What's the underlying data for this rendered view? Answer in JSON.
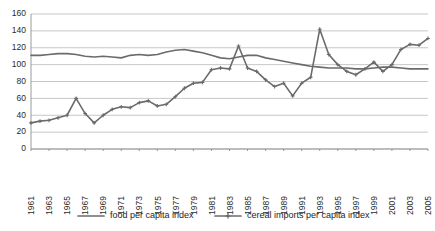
{
  "chart_data": {
    "type": "line",
    "title": "",
    "subtitle": "",
    "xlabel": "",
    "ylabel": "",
    "ylim": [
      0,
      160
    ],
    "ytick_step": 20,
    "yticks": [
      0,
      20,
      40,
      60,
      80,
      100,
      120,
      140,
      160
    ],
    "xlim": [
      1961,
      2005
    ],
    "grid": true,
    "grid_axis": "y",
    "legend_position": "bottom",
    "x": [
      1961,
      1962,
      1963,
      1964,
      1965,
      1966,
      1967,
      1968,
      1969,
      1970,
      1971,
      1972,
      1973,
      1974,
      1975,
      1976,
      1977,
      1978,
      1979,
      1980,
      1981,
      1982,
      1983,
      1984,
      1985,
      1986,
      1987,
      1988,
      1989,
      1990,
      1991,
      1992,
      1993,
      1994,
      1995,
      1996,
      1997,
      1998,
      1999,
      2000,
      2001,
      2002,
      2003,
      2004,
      2005
    ],
    "xticks": [
      1961,
      1963,
      1965,
      1967,
      1969,
      1971,
      1973,
      1975,
      1977,
      1979,
      1981,
      1983,
      1985,
      1987,
      1989,
      1991,
      1993,
      1995,
      1997,
      1999,
      2001,
      2003,
      2005
    ],
    "xtick_labels": [
      "1961",
      "1963",
      "1965",
      "1967",
      "1969",
      "1971",
      "1973",
      "1975",
      "1977",
      "1979",
      "1981",
      "1983",
      "1985",
      "1987",
      "1989",
      "1991",
      "1993",
      "1995",
      "1997",
      "1999",
      "2001",
      "2003",
      "2005"
    ],
    "series": [
      {
        "name": "food per capita index",
        "color": "#6b6b6b",
        "marker": "none",
        "line_width": 1.6,
        "values": [
          111,
          111,
          112,
          113,
          113,
          112,
          110,
          109,
          110,
          109,
          108,
          111,
          112,
          111,
          112,
          115,
          117,
          118,
          116,
          114,
          111,
          108,
          107,
          109,
          111,
          111,
          108,
          106,
          104,
          102,
          100,
          98,
          97,
          96,
          96,
          96,
          95,
          95,
          96,
          97,
          97,
          96,
          95,
          95,
          95
        ]
      },
      {
        "name": "cereal imports per capita index",
        "color": "#6b6b6b",
        "marker": "plus",
        "line_width": 1.6,
        "values": [
          31,
          33,
          34,
          36,
          38,
          40,
          41,
          41,
          42,
          44,
          44,
          44,
          60,
          42,
          32,
          44,
          50,
          54,
          55,
          62,
          70,
          78,
          79,
          92,
          96,
          95,
          96,
          94,
          91,
          96,
          97,
          94,
          93,
          82,
          74,
          62,
          70,
          66,
          78,
          85,
          142,
          112,
          100,
          95,
          92
        ]
      }
    ],
    "note_series_2_detail": {
      "description": "cereal imports per capita index, ordered by year 1961..2005",
      "points": [
        {
          "year": 1961,
          "value": 31
        },
        {
          "year": 1962,
          "value": 33
        },
        {
          "year": 1963,
          "value": 34
        },
        {
          "year": 1964,
          "value": 37
        },
        {
          "year": 1965,
          "value": 40
        },
        {
          "year": 1966,
          "value": 60
        },
        {
          "year": 1967,
          "value": 42
        },
        {
          "year": 1968,
          "value": 31
        },
        {
          "year": 1969,
          "value": 40
        },
        {
          "year": 1970,
          "value": 47
        },
        {
          "year": 1971,
          "value": 50
        },
        {
          "year": 1972,
          "value": 49
        },
        {
          "year": 1973,
          "value": 55
        },
        {
          "year": 1974,
          "value": 57
        },
        {
          "year": 1975,
          "value": 51
        },
        {
          "year": 1976,
          "value": 53
        },
        {
          "year": 1977,
          "value": 62
        },
        {
          "year": 1978,
          "value": 72
        },
        {
          "year": 1979,
          "value": 78
        },
        {
          "year": 1980,
          "value": 79
        },
        {
          "year": 1981,
          "value": 94
        },
        {
          "year": 1982,
          "value": 96
        },
        {
          "year": 1983,
          "value": 95
        },
        {
          "year": 1984,
          "value": 122
        },
        {
          "year": 1985,
          "value": 96
        },
        {
          "year": 1986,
          "value": 92
        },
        {
          "year": 1987,
          "value": 82
        },
        {
          "year": 1988,
          "value": 74
        },
        {
          "year": 1989,
          "value": 78
        },
        {
          "year": 1990,
          "value": 63
        },
        {
          "year": 1991,
          "value": 78
        },
        {
          "year": 1992,
          "value": 85
        },
        {
          "year": 1993,
          "value": 142
        },
        {
          "year": 1994,
          "value": 112
        },
        {
          "year": 1995,
          "value": 100
        },
        {
          "year": 1996,
          "value": 92
        },
        {
          "year": 1997,
          "value": 88
        },
        {
          "year": 1998,
          "value": 95
        },
        {
          "year": 1999,
          "value": 103
        },
        {
          "year": 2000,
          "value": 92
        },
        {
          "year": 2001,
          "value": 100
        },
        {
          "year": 2002,
          "value": 118
        },
        {
          "year": 2003,
          "value": 124
        },
        {
          "year": 2004,
          "value": 123
        },
        {
          "year": 2005,
          "value": 131
        }
      ]
    }
  },
  "legend": {
    "items": [
      {
        "label": "food per capita index"
      },
      {
        "label": "cereal imports per capita index"
      }
    ]
  },
  "colors": {
    "series_line": "#6b6b6b",
    "gridline": "#b9b9b9",
    "axis": "#8f8f8f",
    "text": "#1e1e1e",
    "background": "#ffffff"
  }
}
